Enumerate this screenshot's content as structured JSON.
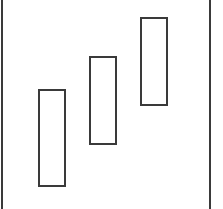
{
  "diagram": {
    "stroke_color": "#3a3a3a",
    "background": "#ffffff",
    "frame": {
      "left_line_x": 1,
      "right_line_x": 209
    },
    "rectangles": [
      {
        "id": "rect-1",
        "x": 38,
        "y": 89,
        "width": 28,
        "height": 98
      },
      {
        "id": "rect-2",
        "x": 89,
        "y": 56,
        "width": 28,
        "height": 89
      },
      {
        "id": "rect-3",
        "x": 140,
        "y": 17,
        "width": 28,
        "height": 89
      }
    ]
  }
}
